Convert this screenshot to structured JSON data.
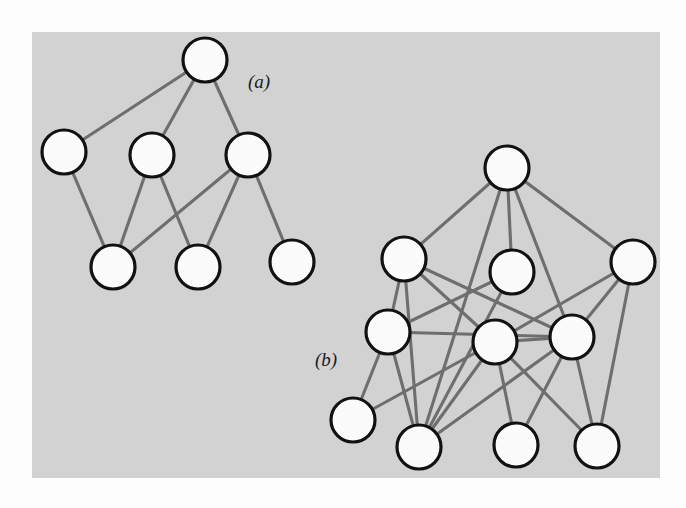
{
  "figure": {
    "caption_a": "(a)",
    "caption_b": "(b)",
    "background_color": "#fdfdfd",
    "panel_color": "#d2d2d2",
    "edge_color": "#6e6e6e",
    "node_fill": "#fbfbfb",
    "node_stroke": "#111111"
  },
  "panel": {
    "x": 32,
    "y": 32,
    "width": 628,
    "height": 446
  },
  "labels": [
    {
      "name": "label-a",
      "text": "(a)",
      "x": 248,
      "y": 88
    },
    {
      "name": "label-b",
      "text": "(b)",
      "x": 315,
      "y": 366
    }
  ],
  "graph_a": {
    "name": "graph-a",
    "caption": "(a)",
    "node_radius": 22,
    "nodes": [
      {
        "id": "a1",
        "x": 205,
        "y": 60
      },
      {
        "id": "a2",
        "x": 64,
        "y": 152
      },
      {
        "id": "a3",
        "x": 152,
        "y": 155
      },
      {
        "id": "a4",
        "x": 248,
        "y": 155
      },
      {
        "id": "a5",
        "x": 113,
        "y": 267
      },
      {
        "id": "a6",
        "x": 198,
        "y": 267
      },
      {
        "id": "a7",
        "x": 292,
        "y": 262
      }
    ],
    "edges": [
      [
        "a1",
        "a2"
      ],
      [
        "a1",
        "a3"
      ],
      [
        "a1",
        "a4"
      ],
      [
        "a2",
        "a5"
      ],
      [
        "a3",
        "a5"
      ],
      [
        "a3",
        "a6"
      ],
      [
        "a4",
        "a5"
      ],
      [
        "a4",
        "a6"
      ],
      [
        "a4",
        "a7"
      ]
    ]
  },
  "graph_b": {
    "name": "graph-b",
    "caption": "(b)",
    "node_radius": 22,
    "nodes": [
      {
        "id": "b1",
        "x": 507,
        "y": 168
      },
      {
        "id": "b2",
        "x": 404,
        "y": 259
      },
      {
        "id": "b3",
        "x": 512,
        "y": 272
      },
      {
        "id": "b4",
        "x": 633,
        "y": 262
      },
      {
        "id": "b5",
        "x": 388,
        "y": 332
      },
      {
        "id": "b6",
        "x": 495,
        "y": 342
      },
      {
        "id": "b7",
        "x": 572,
        "y": 337
      },
      {
        "id": "b8",
        "x": 353,
        "y": 420
      },
      {
        "id": "b9",
        "x": 419,
        "y": 447
      },
      {
        "id": "b10",
        "x": 516,
        "y": 445
      },
      {
        "id": "b11",
        "x": 597,
        "y": 446
      }
    ],
    "edges": [
      [
        "b1",
        "b2"
      ],
      [
        "b1",
        "b3"
      ],
      [
        "b1",
        "b4"
      ],
      [
        "b1",
        "b7"
      ],
      [
        "b1",
        "b9"
      ],
      [
        "b2",
        "b5"
      ],
      [
        "b2",
        "b6"
      ],
      [
        "b2",
        "b7"
      ],
      [
        "b2",
        "b9"
      ],
      [
        "b3",
        "b5"
      ],
      [
        "b3",
        "b9"
      ],
      [
        "b4",
        "b7"
      ],
      [
        "b4",
        "b11"
      ],
      [
        "b4",
        "b6"
      ],
      [
        "b5",
        "b7"
      ],
      [
        "b5",
        "b8"
      ],
      [
        "b5",
        "b9"
      ],
      [
        "b6",
        "b7"
      ],
      [
        "b6",
        "b9"
      ],
      [
        "b6",
        "b10"
      ],
      [
        "b6",
        "b11"
      ],
      [
        "b7",
        "b9"
      ],
      [
        "b7",
        "b10"
      ],
      [
        "b7",
        "b11"
      ],
      [
        "b8",
        "b6"
      ]
    ]
  }
}
